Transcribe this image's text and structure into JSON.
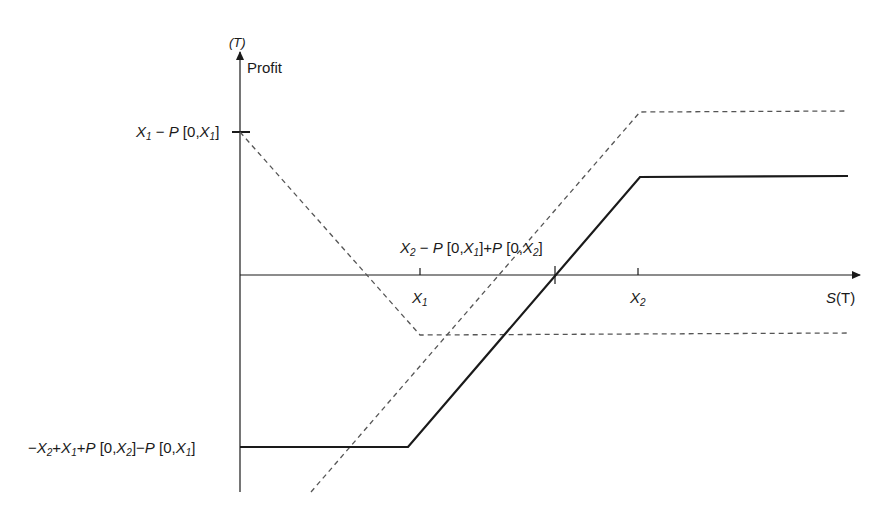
{
  "diagram": {
    "title_fragment": "(T)",
    "y_axis_label": "Profit",
    "x_axis_label": "S(T)",
    "x_ticks": [
      {
        "label": "X1",
        "x": 420
      },
      {
        "label": "X2",
        "x": 638
      }
    ],
    "breakeven_label": "X2 − P[0,X1] + P[0,X2]",
    "y_levels": {
      "max_put": "X1 − P[0,X1]",
      "min_spread": "−X2 + X1 + P[0,X2] − P[0,X1]"
    },
    "lines": [
      {
        "name": "long put payoff",
        "style": "dashed"
      },
      {
        "name": "long call / strike spread payoff",
        "style": "dashed"
      },
      {
        "name": "combined strategy payoff",
        "style": "solid"
      }
    ],
    "colors": {
      "ink": "#1a1a1a",
      "dash": "#555555"
    }
  },
  "labels": {
    "T_paren": "(T)",
    "profit": "Profit",
    "S": "S",
    "ST_paren": "(T)",
    "X": "X",
    "one": "1",
    "two": "2",
    "P": "P",
    "open0": " [0,",
    "close": "]",
    "minus": "−",
    "plus": "+"
  }
}
